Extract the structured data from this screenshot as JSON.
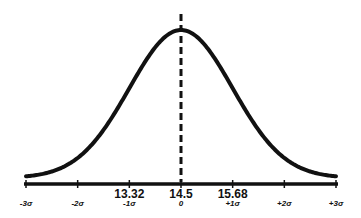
{
  "chart_data": {
    "type": "line",
    "title": "",
    "xlabel": "",
    "ylabel": "",
    "mean": 14.5,
    "std_dev": 1.18,
    "sigma_ticks": [
      "-3σ",
      "-2σ",
      "-1σ",
      "0",
      "+1σ",
      "+2σ",
      "+3σ"
    ],
    "value_labels": [
      {
        "sigma": -1,
        "label": "13.32"
      },
      {
        "sigma": 0,
        "label": "14.5"
      },
      {
        "sigma": 1,
        "label": "15.68"
      }
    ],
    "xlim": [
      -3,
      3
    ],
    "grid": false,
    "legend": "none",
    "colors": {
      "curve": "#111111",
      "axis": "#111111",
      "mean_line": "#111111"
    }
  },
  "layout": {
    "axis_y": 184,
    "x_left": 26,
    "x_right": 336,
    "curve_base_y": 178,
    "curve_peak_y": 30,
    "mean_line_top": 14
  }
}
